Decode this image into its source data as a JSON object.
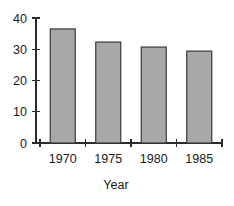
{
  "chart_data": {
    "type": "bar",
    "title": "",
    "subtitle": "",
    "categories": [
      "1970",
      "1975",
      "1980",
      "1985"
    ],
    "values": [
      36.5,
      32.3,
      30.7,
      29.4
    ],
    "xlabel": "Year",
    "ylabel": "",
    "ylim": [
      0,
      40
    ],
    "yticks": [
      0,
      10,
      20,
      30,
      40
    ],
    "ytick_labels": [
      "0",
      "10",
      "20",
      "30",
      "40"
    ],
    "xtick_labels": [
      "1970",
      "1975",
      "1980",
      "1985"
    ],
    "grid": false,
    "legend": null,
    "annotations": [],
    "colors": {
      "bar_fill": "#a8a8a8",
      "bar_stroke": "#3a3a3a",
      "axis": "#2b2b2b",
      "text": "#1a1a1a",
      "background": "#ffffff"
    }
  }
}
